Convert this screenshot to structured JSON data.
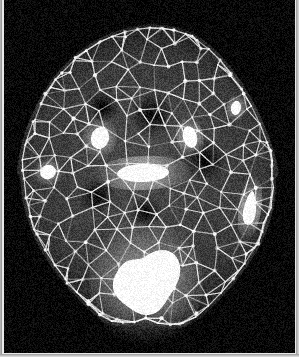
{
  "image": {
    "kind": "grayscale-medical-scan",
    "modality_look": "dark background with bright triangular surface mesh",
    "width": 299,
    "height": 357,
    "background_color": "#050505",
    "paper_margin_color": "#e9e9e9",
    "mesh_color": "#e8e8e8",
    "blob_color": "#ffffff",
    "tissue_color": "#3a3a3a"
  },
  "subject": {
    "outline_name": "head-cross-section",
    "center_x": 148,
    "center_y": 176,
    "radius_x": 128,
    "radius_y": 168
  },
  "mesh": {
    "type": "triangular-wireframe",
    "node_count": 260,
    "seed": 20240117,
    "line_width": 1.1,
    "brightness": 0.85
  },
  "blobs": [
    {
      "name": "blob-left-small",
      "cx": 48,
      "cy": 172,
      "rx": 8,
      "ry": 7,
      "rot": -20
    },
    {
      "name": "blob-upper-left-mid",
      "cx": 100,
      "cy": 138,
      "rx": 9,
      "ry": 11,
      "rot": 15
    },
    {
      "name": "blob-upper-right-mid",
      "cx": 190,
      "cy": 137,
      "rx": 7,
      "ry": 11,
      "rot": -15
    },
    {
      "name": "blob-upper-right-small",
      "cx": 236,
      "cy": 108,
      "rx": 5,
      "ry": 7,
      "rot": 10
    },
    {
      "name": "blob-center-band",
      "cx": 143,
      "cy": 173,
      "rx": 26,
      "ry": 9,
      "rot": -2
    },
    {
      "name": "blob-right-teardrop",
      "cx": 250,
      "cy": 208,
      "rx": 6,
      "ry": 17,
      "rot": 8
    },
    {
      "name": "blob-lower-large",
      "cx": 146,
      "cy": 282,
      "rx": 30,
      "ry": 34,
      "rot": 0
    }
  ],
  "dark_regions": [
    {
      "name": "dark-upper-center",
      "cx": 152,
      "cy": 115,
      "rx": 22,
      "ry": 18
    },
    {
      "name": "dark-left-orbit",
      "cx": 103,
      "cy": 107,
      "rx": 16,
      "ry": 14
    },
    {
      "name": "dark-right-orbit",
      "cx": 205,
      "cy": 160,
      "rx": 20,
      "ry": 22
    },
    {
      "name": "dark-mid-left",
      "cx": 97,
      "cy": 196,
      "rx": 18,
      "ry": 16
    },
    {
      "name": "dark-center-low",
      "cx": 146,
      "cy": 212,
      "rx": 16,
      "ry": 13
    },
    {
      "name": "dark-bottom-notch",
      "cx": 147,
      "cy": 330,
      "rx": 30,
      "ry": 20
    }
  ]
}
